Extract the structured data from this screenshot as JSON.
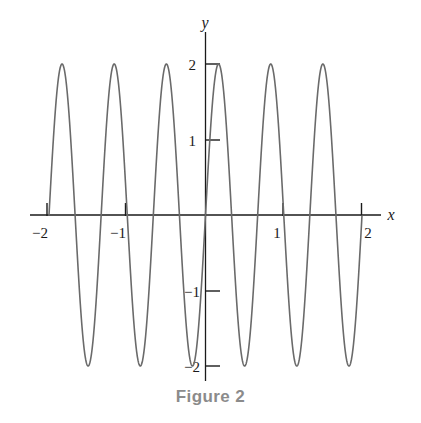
{
  "figure": {
    "caption": "Figure 2",
    "caption_color": "#8b8b8b",
    "background_color": "#ffffff"
  },
  "axes": {
    "x_axis_name": "x",
    "y_axis_name": "y",
    "axis_color": "#1a1a1a"
  },
  "labels": {
    "x_neg2": "−2",
    "x_neg1": "−1",
    "x_pos1": "1",
    "x_pos2": "2",
    "y_pos2": "2",
    "y_pos1": "1",
    "y_neg1": "−1",
    "y_neg2": "−2"
  },
  "chart_data": {
    "type": "line",
    "title": "Figure 2",
    "xlabel": "x",
    "ylabel": "y",
    "grid": false,
    "legend": "none",
    "curve_color": "#6a6a6a",
    "curve_width": 1.6,
    "xlim": [
      -2.08,
      2.08
    ],
    "ylim": [
      -2.25,
      2.25
    ],
    "xticks": [
      -2,
      -1,
      1,
      2
    ],
    "xticklabels": [
      "−2",
      "−1",
      "1",
      "2"
    ],
    "yticks": [
      2,
      1,
      -1,
      -2
    ],
    "yticklabels": [
      "2",
      "1",
      "−1",
      "−2"
    ],
    "amplitude": 2,
    "period": 0.6667,
    "cycles_visible": 6,
    "function": "y = 2 sin(3πx)",
    "phase_note": "crosses zero rising at x = -2",
    "peaks_x": [
      -1.833,
      -1.167,
      -0.5,
      0.167,
      0.833,
      1.5
    ],
    "peaks_y": [
      2,
      2,
      2,
      2,
      2,
      2
    ],
    "troughs_x": [
      -1.5,
      -0.833,
      -0.167,
      0.5,
      1.167,
      1.833
    ],
    "troughs_y": [
      -2,
      -2,
      -2,
      -2,
      -2,
      -2
    ],
    "zero_crossings_x": [
      -2,
      -1.667,
      -1.333,
      -1,
      -0.667,
      -0.333,
      0,
      0.333,
      0.667,
      1,
      1.333,
      1.667,
      2
    ]
  }
}
